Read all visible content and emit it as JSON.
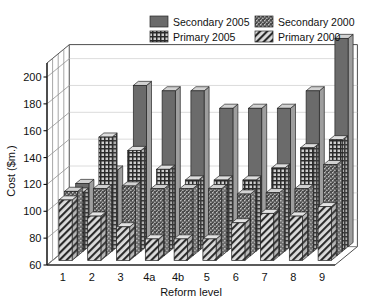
{
  "chart_data": {
    "type": "bar",
    "subtype": "3d-grouped-bar",
    "title": "",
    "xlabel": "Reform level",
    "ylabel": "Cost ($m.)",
    "ylim": [
      60,
      200
    ],
    "ytick_step": 20,
    "yticks": [
      "200",
      "180",
      "160",
      "140",
      "120",
      "100",
      "80",
      "60"
    ],
    "ytick_values": [
      200,
      180,
      160,
      140,
      120,
      100,
      80,
      60
    ],
    "grid": true,
    "legend_position": "top-center",
    "categories": [
      "1",
      "2",
      "3",
      "4a",
      "4b",
      "5",
      "6",
      "7",
      "8",
      "9"
    ],
    "series": [
      {
        "name": "Secondary 2005",
        "fill": "solid-dark",
        "color": "#666666",
        "depth_index": 0,
        "values": [
          107,
          117,
          180,
          176,
          176,
          163,
          163,
          163,
          176,
          215
        ]
      },
      {
        "name": "Primary 2005",
        "fill": "grid-crosshatch",
        "color": "#c9c9c9",
        "depth_index": 1,
        "values": [
          104,
          145,
          135,
          121,
          113,
          113,
          113,
          122,
          137,
          143
        ]
      },
      {
        "name": "Secondary 2000",
        "fill": "speckle",
        "color": "#8a8a8a",
        "depth_index": 2,
        "values": [
          108,
          110,
          112,
          110,
          110,
          110,
          106,
          107,
          110,
          128
        ]
      },
      {
        "name": "Primary 2000",
        "fill": "diagonal-hatch",
        "color": "#d7d7d7",
        "depth_index": 3,
        "values": [
          105,
          93,
          85,
          76,
          76,
          76,
          88,
          95,
          93,
          100
        ]
      }
    ]
  },
  "legend": {
    "entries": [
      {
        "label": "Secondary 2005",
        "swatch": "solid-dark"
      },
      {
        "label": "Secondary 2000",
        "swatch": "speckle"
      },
      {
        "label": "Primary 2005",
        "swatch": "grid-crosshatch"
      },
      {
        "label": "Primary 2000",
        "swatch": "diagonal-hatch"
      }
    ]
  },
  "colors": {
    "solid_dark": "#6b6b6b",
    "speckle_base": "#9a9a9a",
    "crosshatch_base": "#cfcfcf",
    "hatch_base": "#dcdcdc",
    "bar_side": "#b8b8b8",
    "bar_top": "#e2e2e2",
    "axis": "#1a1a1a",
    "grid": "#9b9b9b",
    "background": "#ffffff"
  }
}
